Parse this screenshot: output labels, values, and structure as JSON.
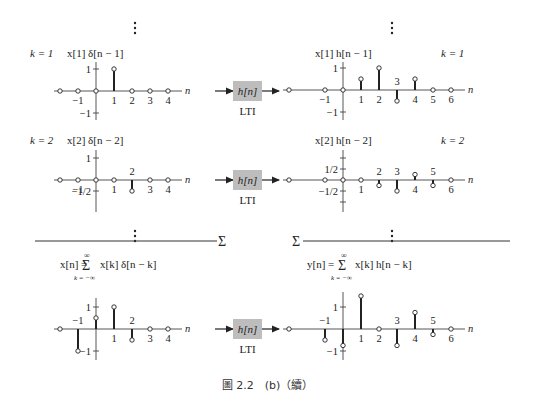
{
  "caption": "圖 2.2　(b)（續）",
  "system_box": {
    "label": "h[n]",
    "sublabel": "LTI",
    "fill": "#bdbdbd"
  },
  "sum_symbol": "Σ",
  "rows": [
    {
      "k_label": "k = 1",
      "input_title": "x[1] δ[n − 1]",
      "output_title": "x[1] h[n − 1]"
    },
    {
      "k_label": "k = 2",
      "input_title": "x[2] δ[n − 2]",
      "output_title": "x[2] h[n − 2]"
    }
  ],
  "sum_input_formula": {
    "lhs": "x[n] = ",
    "sigma": "Σ",
    "upper": "∞",
    "lower": "k = −∞",
    "rhs": "x[k] δ[n − k]"
  },
  "sum_output_formula": {
    "lhs": "y[n] = ",
    "sigma": "Σ",
    "upper": "∞",
    "lower": "k = −∞",
    "rhs": "x[k] h[n − k]"
  },
  "axis_label": "n",
  "chart_data": [
    {
      "type": "stem",
      "title": "x[1] δ[n − 1]",
      "k": 1,
      "x": [
        -2,
        -1,
        0,
        1,
        2,
        3,
        4
      ],
      "y": [
        0,
        0,
        0,
        1,
        0,
        0,
        0
      ],
      "x_tick_labels": [
        "-1",
        "1",
        "2",
        "3",
        "4"
      ],
      "y_tick_labels": [
        "1",
        "-1"
      ],
      "xlabel": "n"
    },
    {
      "type": "stem",
      "title": "x[1] h[n − 1]",
      "k": 1,
      "x": [
        -3,
        -1,
        0,
        1,
        2,
        3,
        4,
        5,
        6
      ],
      "y": [
        0,
        0,
        0,
        0.5,
        1,
        -0.5,
        0.5,
        0,
        0
      ],
      "x_tick_labels": [
        "-1",
        "1",
        "2",
        "3",
        "4",
        "5",
        "6"
      ],
      "y_tick_labels": [
        "1",
        "-1"
      ],
      "xlabel": "n"
    },
    {
      "type": "stem",
      "title": "x[2] δ[n − 2]",
      "k": 2,
      "x": [
        -2,
        -1,
        0,
        1,
        2,
        3,
        4
      ],
      "y": [
        0,
        0,
        0,
        0,
        -0.5,
        0,
        0
      ],
      "x_tick_labels": [
        "-1",
        "1",
        "2",
        "3",
        "4"
      ],
      "y_tick_labels": [
        "1",
        "-1/2"
      ],
      "xlabel": "n"
    },
    {
      "type": "stem",
      "title": "x[2] h[n − 2]",
      "k": 2,
      "x": [
        -3,
        -1,
        0,
        1,
        2,
        3,
        4,
        5,
        6
      ],
      "y": [
        0,
        0,
        0,
        0,
        -0.25,
        -0.5,
        0.25,
        -0.25,
        0
      ],
      "x_tick_labels": [
        "1",
        "2",
        "3",
        "4",
        "5",
        "6"
      ],
      "y_tick_labels": [
        "1/2",
        "-1/2"
      ],
      "xlabel": "n"
    },
    {
      "type": "stem",
      "title": "x[n] = Σ x[k] δ[n − k]",
      "x": [
        -2,
        -1,
        0,
        1,
        2,
        3,
        4
      ],
      "y": [
        0,
        -1,
        0.5,
        1,
        -0.5,
        0,
        0
      ],
      "x_tick_labels": [
        "-1",
        "1",
        "2",
        "3",
        "4"
      ],
      "y_tick_labels": [
        "1",
        "-1"
      ],
      "xlabel": "n"
    },
    {
      "type": "stem",
      "title": "y[n] = Σ x[k] h[n − k]",
      "x": [
        -3,
        -1,
        0,
        1,
        2,
        3,
        4,
        5,
        6
      ],
      "y": [
        0,
        -0.5,
        -0.75,
        1.5,
        0,
        -0.75,
        0.75,
        -0.25,
        0
      ],
      "x_tick_labels": [
        "-1",
        "1",
        "2",
        "3",
        "4",
        "5",
        "6"
      ],
      "y_tick_labels": [
        "1",
        "-1"
      ],
      "xlabel": "n"
    }
  ]
}
